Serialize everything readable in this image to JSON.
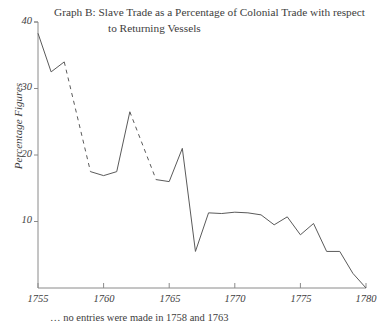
{
  "chart_data": {
    "type": "line",
    "title": "Graph B: Slave Trade as a Percentage of Colonial Trade with respect to Returning Vessels",
    "title_line1": "Graph B: Slave Trade as a Percentage of Colonial Trade with respect",
    "title_line2": "to Returning Vessels",
    "xlabel": "",
    "ylabel": "Percentage Figures",
    "footnote": "… no entries were made in 1758 and 1763",
    "xlim": [
      1755,
      1780
    ],
    "ylim": [
      0,
      40
    ],
    "xticks": [
      1755,
      1760,
      1765,
      1770,
      1775,
      1780
    ],
    "yticks": [
      10,
      20,
      30,
      40
    ],
    "grid": false,
    "legend": "none",
    "missing_years": [
      1758,
      1763
    ],
    "line_color": "#5a5a5a",
    "axis_color": "#8a8a8a",
    "x": [
      1755,
      1756,
      1757,
      1759,
      1760,
      1761,
      1762,
      1764,
      1765,
      1766,
      1767,
      1768,
      1769,
      1770,
      1771,
      1772,
      1773,
      1774,
      1775,
      1776,
      1777,
      1778,
      1779,
      1780
    ],
    "values": [
      38.3,
      32.5,
      34.0,
      17.5,
      16.9,
      17.5,
      26.5,
      16.3,
      16.0,
      21.0,
      5.5,
      11.3,
      11.2,
      11.4,
      11.3,
      11.0,
      9.5,
      10.7,
      8.0,
      9.7,
      5.5,
      5.5,
      2.2,
      0.0
    ],
    "dashed_segments": [
      [
        1757,
        1759
      ],
      [
        1762,
        1764
      ]
    ]
  }
}
